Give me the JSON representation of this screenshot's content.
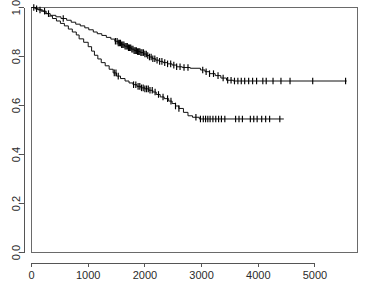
{
  "chart_data": {
    "type": "line",
    "title": "",
    "subtitle": "",
    "xlabel": "",
    "ylabel": "",
    "xlim": [
      0,
      5750
    ],
    "ylim": [
      0.0,
      1.0
    ],
    "grid": false,
    "legend": "none",
    "plot_style": "kaplan-meier-step",
    "axis": {
      "x_ticks": [
        0,
        1000,
        2000,
        3000,
        4000,
        5000
      ],
      "x_tick_labels": [
        "0",
        "1000",
        "2000",
        "3000",
        "4000",
        "5000"
      ],
      "y_ticks": [
        0.0,
        0.2,
        0.4,
        0.6,
        0.8,
        1.0
      ],
      "y_tick_labels": [
        "0.0",
        "0.2",
        "0.4",
        "0.6",
        "0.8",
        "1.0"
      ],
      "y_label_rotation": -90
    },
    "colors": {
      "curve": "#111111",
      "censor": "#000000",
      "axis": "#555555",
      "frame": "#6a6a6a",
      "background": "#ffffff",
      "tick_text": "#2b2b2b"
    },
    "series": [
      {
        "name": "upper-curve",
        "stroke": "#111111",
        "final_survival": 0.7,
        "max_time": 5560,
        "steps": [
          [
            0,
            1.0
          ],
          [
            60,
            1.0
          ],
          [
            60,
            0.995
          ],
          [
            120,
            0.995
          ],
          [
            120,
            0.99
          ],
          [
            200,
            0.99
          ],
          [
            200,
            0.985
          ],
          [
            260,
            0.985
          ],
          [
            260,
            0.975
          ],
          [
            330,
            0.975
          ],
          [
            330,
            0.968
          ],
          [
            430,
            0.968
          ],
          [
            430,
            0.962
          ],
          [
            520,
            0.962
          ],
          [
            520,
            0.955
          ],
          [
            620,
            0.955
          ],
          [
            620,
            0.948
          ],
          [
            700,
            0.948
          ],
          [
            700,
            0.94
          ],
          [
            780,
            0.94
          ],
          [
            780,
            0.932
          ],
          [
            860,
            0.932
          ],
          [
            860,
            0.925
          ],
          [
            940,
            0.925
          ],
          [
            940,
            0.917
          ],
          [
            1010,
            0.917
          ],
          [
            1010,
            0.909
          ],
          [
            1090,
            0.909
          ],
          [
            1090,
            0.9
          ],
          [
            1160,
            0.9
          ],
          [
            1160,
            0.893
          ],
          [
            1240,
            0.893
          ],
          [
            1240,
            0.886
          ],
          [
            1320,
            0.886
          ],
          [
            1320,
            0.878
          ],
          [
            1400,
            0.878
          ],
          [
            1400,
            0.871
          ],
          [
            1470,
            0.871
          ],
          [
            1470,
            0.862
          ],
          [
            1530,
            0.862
          ],
          [
            1530,
            0.855
          ],
          [
            1590,
            0.855
          ],
          [
            1590,
            0.848
          ],
          [
            1640,
            0.848
          ],
          [
            1640,
            0.842
          ],
          [
            1700,
            0.842
          ],
          [
            1700,
            0.836
          ],
          [
            1760,
            0.836
          ],
          [
            1760,
            0.83
          ],
          [
            1810,
            0.83
          ],
          [
            1810,
            0.824
          ],
          [
            1860,
            0.824
          ],
          [
            1860,
            0.82
          ],
          [
            1920,
            0.82
          ],
          [
            1920,
            0.816
          ],
          [
            1980,
            0.816
          ],
          [
            1980,
            0.81
          ],
          [
            2030,
            0.81
          ],
          [
            2030,
            0.804
          ],
          [
            2080,
            0.804
          ],
          [
            2080,
            0.798
          ],
          [
            2130,
            0.798
          ],
          [
            2130,
            0.791
          ],
          [
            2190,
            0.791
          ],
          [
            2190,
            0.785
          ],
          [
            2250,
            0.785
          ],
          [
            2250,
            0.78
          ],
          [
            2320,
            0.78
          ],
          [
            2320,
            0.775
          ],
          [
            2400,
            0.775
          ],
          [
            2400,
            0.77
          ],
          [
            2480,
            0.77
          ],
          [
            2480,
            0.765
          ],
          [
            2560,
            0.765
          ],
          [
            2560,
            0.758
          ],
          [
            2660,
            0.758
          ],
          [
            2660,
            0.755
          ],
          [
            2800,
            0.755
          ],
          [
            2800,
            0.752
          ],
          [
            2980,
            0.752
          ],
          [
            2980,
            0.745
          ],
          [
            3060,
            0.745
          ],
          [
            3060,
            0.738
          ],
          [
            3140,
            0.738
          ],
          [
            3140,
            0.73
          ],
          [
            3240,
            0.73
          ],
          [
            3240,
            0.722
          ],
          [
            3340,
            0.722
          ],
          [
            3340,
            0.712
          ],
          [
            3440,
            0.712
          ],
          [
            3440,
            0.703
          ],
          [
            3560,
            0.703
          ],
          [
            3560,
            0.7
          ],
          [
            5560,
            0.7
          ]
        ],
        "censor_times": [
          40,
          90,
          150,
          230,
          300,
          560,
          1480,
          1510,
          1530,
          1550,
          1570,
          1590,
          1610,
          1630,
          1650,
          1670,
          1690,
          1710,
          1730,
          1750,
          1770,
          1790,
          1810,
          1830,
          1850,
          1870,
          1890,
          1910,
          1930,
          1950,
          1975,
          2000,
          2025,
          2050,
          2080,
          2110,
          2140,
          2175,
          2215,
          2260,
          2300,
          2350,
          2400,
          2455,
          2510,
          2560,
          2620,
          2690,
          2760,
          3020,
          3080,
          3140,
          3210,
          3290,
          3380,
          3460,
          3520,
          3580,
          3640,
          3700,
          3760,
          3830,
          3900,
          3970,
          4080,
          4140,
          4260,
          4400,
          4560,
          4960,
          5540
        ]
      },
      {
        "name": "lower-curve",
        "stroke": "#111111",
        "final_survival": 0.545,
        "max_time": 4450,
        "steps": [
          [
            0,
            1.0
          ],
          [
            80,
            1.0
          ],
          [
            80,
            0.993
          ],
          [
            170,
            0.993
          ],
          [
            170,
            0.985
          ],
          [
            240,
            0.985
          ],
          [
            240,
            0.975
          ],
          [
            300,
            0.975
          ],
          [
            300,
            0.965
          ],
          [
            370,
            0.965
          ],
          [
            370,
            0.955
          ],
          [
            440,
            0.955
          ],
          [
            440,
            0.945
          ],
          [
            510,
            0.945
          ],
          [
            510,
            0.935
          ],
          [
            580,
            0.935
          ],
          [
            580,
            0.925
          ],
          [
            650,
            0.925
          ],
          [
            650,
            0.912
          ],
          [
            720,
            0.912
          ],
          [
            720,
            0.9
          ],
          [
            790,
            0.9
          ],
          [
            790,
            0.888
          ],
          [
            840,
            0.888
          ],
          [
            840,
            0.872
          ],
          [
            920,
            0.872
          ],
          [
            920,
            0.858
          ],
          [
            1000,
            0.858
          ],
          [
            1000,
            0.84
          ],
          [
            1060,
            0.84
          ],
          [
            1060,
            0.822
          ],
          [
            1110,
            0.822
          ],
          [
            1110,
            0.805
          ],
          [
            1170,
            0.805
          ],
          [
            1170,
            0.79
          ],
          [
            1230,
            0.79
          ],
          [
            1230,
            0.775
          ],
          [
            1300,
            0.775
          ],
          [
            1300,
            0.762
          ],
          [
            1370,
            0.762
          ],
          [
            1370,
            0.748
          ],
          [
            1440,
            0.748
          ],
          [
            1440,
            0.733
          ],
          [
            1500,
            0.733
          ],
          [
            1500,
            0.72
          ],
          [
            1570,
            0.72
          ],
          [
            1570,
            0.71
          ],
          [
            1650,
            0.71
          ],
          [
            1650,
            0.7
          ],
          [
            1720,
            0.7
          ],
          [
            1720,
            0.692
          ],
          [
            1790,
            0.692
          ],
          [
            1790,
            0.685
          ],
          [
            1860,
            0.685
          ],
          [
            1860,
            0.678
          ],
          [
            1930,
            0.678
          ],
          [
            1930,
            0.672
          ],
          [
            2000,
            0.672
          ],
          [
            2000,
            0.668
          ],
          [
            2070,
            0.668
          ],
          [
            2070,
            0.662
          ],
          [
            2140,
            0.662
          ],
          [
            2140,
            0.655
          ],
          [
            2200,
            0.655
          ],
          [
            2200,
            0.645
          ],
          [
            2270,
            0.645
          ],
          [
            2270,
            0.635
          ],
          [
            2340,
            0.635
          ],
          [
            2340,
            0.628
          ],
          [
            2420,
            0.628
          ],
          [
            2420,
            0.618
          ],
          [
            2480,
            0.618
          ],
          [
            2480,
            0.608
          ],
          [
            2540,
            0.608
          ],
          [
            2540,
            0.598
          ],
          [
            2600,
            0.598
          ],
          [
            2600,
            0.588
          ],
          [
            2680,
            0.588
          ],
          [
            2680,
            0.572
          ],
          [
            2760,
            0.572
          ],
          [
            2760,
            0.558
          ],
          [
            2840,
            0.558
          ],
          [
            2840,
            0.552
          ],
          [
            2960,
            0.552
          ],
          [
            2960,
            0.545
          ],
          [
            4450,
            0.545
          ]
        ],
        "censor_times": [
          1460,
          1490,
          1530,
          1800,
          1840,
          1880,
          1910,
          1940,
          1970,
          2000,
          2030,
          2060,
          2090,
          2130,
          2180,
          2240,
          2320,
          2400,
          2460,
          2540,
          2600,
          2900,
          2980,
          3030,
          3070,
          3110,
          3150,
          3200,
          3250,
          3300,
          3350,
          3410,
          3600,
          3660,
          3720,
          3860,
          3920,
          3980,
          4060,
          4130,
          4200,
          4380
        ]
      }
    ]
  }
}
